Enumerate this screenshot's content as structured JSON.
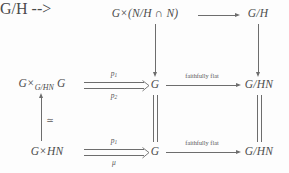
{
  "diagram": {
    "kind": "commutative-diagram",
    "ink_color": "#6d6d6d",
    "text_color": "#4c4c4c",
    "background_color": "#fdfdfd",
    "nodes": {
      "top_left": {
        "main": "G",
        "times": "×",
        "rest": "(N/H ∩ N)"
      },
      "top_right": {
        "text": "G/H"
      },
      "mid_left": {
        "lead": "G",
        "times": "×",
        "sub": "G/HN",
        "tail": "G"
      },
      "mid_center": {
        "text": "G"
      },
      "mid_right": {
        "text": "G/HN"
      },
      "bottom_left": {
        "lead": "G",
        "times": "×",
        "tail": "HN"
      },
      "bottom_center": {
        "text": "G"
      },
      "bottom_right": {
        "text": "G/HN"
      }
    },
    "arrow_labels": {
      "mid_p1": {
        "base": "p",
        "sub": "1"
      },
      "mid_p2": {
        "base": "p",
        "sub": "2"
      },
      "bottom_p1": {
        "base": "p",
        "sub": "1"
      },
      "bottom_mu": "μ",
      "iso": "≃",
      "mid_faithfully_flat": "faithfully flat",
      "bottom_faithfully_flat": "faithfully flat"
    }
  }
}
